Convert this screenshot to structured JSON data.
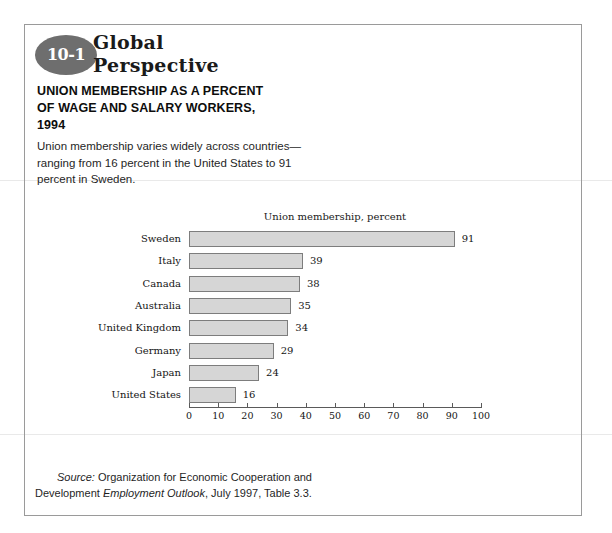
{
  "badge": {
    "number": "10-1",
    "wordmark_line1": "Global",
    "wordmark_line2": "Perspective",
    "color": "#6e6e6e"
  },
  "title": {
    "line1": "UNION MEMBERSHIP AS A PERCENT",
    "line2": "OF WAGE AND SALARY WORKERS,",
    "line3": "1994"
  },
  "caption": {
    "line1": "Union membership varies widely across countries—",
    "line2": "ranging from 16 percent in the United States to 91",
    "line3": "percent in Sweden."
  },
  "source": {
    "label": "Source:",
    "text_before_italic": " Organization for Economic Cooperation and",
    "line2_prefix": "Development ",
    "line2_italic": "Employment Outlook",
    "line2_suffix": ", July 1997, Table 3.3."
  },
  "chart_data": {
    "type": "bar",
    "orientation": "horizontal",
    "title": "Union membership, percent",
    "xlabel": "",
    "ylabel": "",
    "categories": [
      "Sweden",
      "Italy",
      "Canada",
      "Australia",
      "United Kingdom",
      "Germany",
      "Japan",
      "United States"
    ],
    "values": [
      91,
      39,
      38,
      35,
      34,
      29,
      24,
      16
    ],
    "value_labels": [
      "91",
      "39",
      "38",
      "35",
      "34",
      "29",
      "24",
      "16"
    ],
    "xlim": [
      0,
      100
    ],
    "xticks": [
      0,
      10,
      20,
      30,
      40,
      50,
      60,
      70,
      80,
      90,
      100
    ],
    "xtick_labels": [
      "0",
      "10",
      "20",
      "30",
      "40",
      "50",
      "60",
      "70",
      "80",
      "90",
      "100"
    ],
    "grid": false,
    "legend": null,
    "bar_fill": "#d6d6d6",
    "bar_border": "#7d7d7d"
  }
}
